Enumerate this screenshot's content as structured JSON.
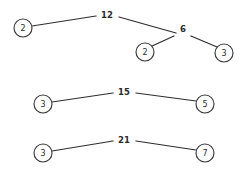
{
  "diagram": {
    "title": "",
    "type": "factor-tree-graph",
    "background_color": "#ffffff",
    "stroke_color": "#2e2e2e",
    "node_fill_color": "#ffffff",
    "node_stroke_color": "#3a3a3a",
    "text_color": "#2b2b2b",
    "width": 241,
    "height": 172,
    "groups": [
      {
        "name": "factor-tree-12",
        "root_label": "12",
        "root_x": 107,
        "root_y": 15,
        "nodes": [
          {
            "label": "2",
            "x": 23,
            "y": 28,
            "r": 9
          },
          {
            "label": "2",
            "x": 145,
            "y": 52,
            "r": 9
          },
          {
            "label": "3",
            "x": 224,
            "y": 53,
            "r": 9
          }
        ],
        "internal_labels": [
          {
            "label": "6",
            "x": 183,
            "y": 29
          }
        ],
        "edges": [
          {
            "from_label": "12",
            "to_label": "2",
            "x1": 32,
            "y1": 26,
            "x2": 96,
            "y2": 16
          },
          {
            "from_label": "12",
            "to_label": "6",
            "x1": 119,
            "y1": 17,
            "x2": 176,
            "y2": 33
          },
          {
            "from_label": "6",
            "to_label": "2",
            "x1": 174,
            "y1": 36,
            "x2": 152,
            "y2": 46
          },
          {
            "from_label": "6",
            "to_label": "3",
            "x1": 191,
            "y1": 36,
            "x2": 217,
            "y2": 47
          }
        ]
      },
      {
        "name": "factor-tree-15",
        "root_label": "15",
        "root_x": 124,
        "root_y": 92,
        "nodes": [
          {
            "label": "3",
            "x": 43,
            "y": 104,
            "r": 9
          },
          {
            "label": "5",
            "x": 205,
            "y": 104,
            "r": 9
          }
        ],
        "internal_labels": [],
        "edges": [
          {
            "from_label": "15",
            "to_label": "3",
            "x1": 52,
            "y1": 102,
            "x2": 113,
            "y2": 93
          },
          {
            "from_label": "15",
            "to_label": "5",
            "x1": 136,
            "y1": 93,
            "x2": 196,
            "y2": 101
          }
        ]
      },
      {
        "name": "factor-tree-21",
        "root_label": "21",
        "root_x": 124,
        "root_y": 140,
        "nodes": [
          {
            "label": "3",
            "x": 43,
            "y": 153,
            "r": 9
          },
          {
            "label": "7",
            "x": 205,
            "y": 153,
            "r": 9
          }
        ],
        "internal_labels": [],
        "edges": [
          {
            "from_label": "21",
            "to_label": "3",
            "x1": 52,
            "y1": 151,
            "x2": 113,
            "y2": 141
          },
          {
            "from_label": "21",
            "to_label": "7",
            "x1": 136,
            "y1": 141,
            "x2": 196,
            "y2": 150
          }
        ]
      }
    ]
  }
}
